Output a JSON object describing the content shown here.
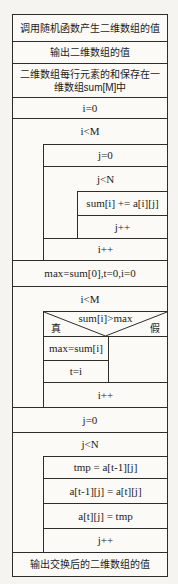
{
  "diagram": {
    "type": "nassi-shneiderman",
    "steps": {
      "generate_random": "调用随机函数产生二维数组的值",
      "output_array": "输出二维数组的值",
      "row_sum_note": "二维数组每行元素的和保存在一维数组sum[M]中",
      "init_i": "i=0",
      "sum_loop_cond": "i<M",
      "init_j": "j=0",
      "inner_loop_cond": "j<N",
      "accumulate_sum": "sum[i] += a[i][j]",
      "inc_j": "j++",
      "inc_i": "i++",
      "init_max": "max=sum[0],t=0,i=0",
      "max_loop_cond": "i<M",
      "decision_cond": "sum[i]>max",
      "decision_true_label": "真",
      "decision_false_label": "假",
      "update_max": "max=sum[i]",
      "update_t": "t=i",
      "inc_i2": "i++",
      "init_j2": "j=0",
      "swap_loop_cond": "j<N",
      "swap_tmp": "tmp = a[t-1][j]",
      "swap_assign": "a[t-1][j] = a[t][j]",
      "swap_back": "a[t][j] = tmp",
      "inc_j2": "j++",
      "output_swapped": "输出交换后的二维数组的值"
    }
  }
}
